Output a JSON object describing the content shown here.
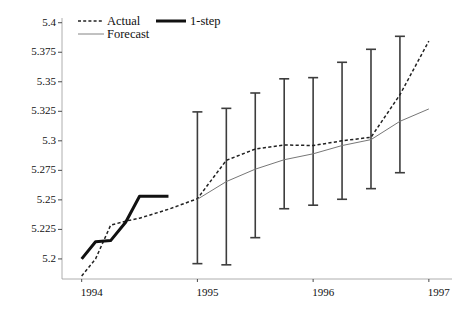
{
  "chart_data": {
    "type": "line",
    "title": "",
    "xlabel": "",
    "ylabel": "",
    "xlim": [
      1993.83,
      1997.2
    ],
    "ylim": [
      5.183,
      5.404
    ],
    "grid": false,
    "x_ticks": [
      "1994",
      "1995",
      "1996",
      "1997"
    ],
    "x_tick_values": [
      1994,
      1995,
      1996,
      1997
    ],
    "y_ticks": [
      "5.2",
      "5.225",
      "5.25",
      "5.275",
      "5.3",
      "5.325",
      "5.35",
      "5.375",
      "5.4"
    ],
    "y_tick_values": [
      5.2,
      5.225,
      5.25,
      5.275,
      5.3,
      5.325,
      5.35,
      5.375,
      5.4
    ],
    "legend": {
      "position": "top-left",
      "entries": [
        {
          "label": "Actual",
          "style": "dashed",
          "width": 1.4,
          "color": "#222222"
        },
        {
          "label": "Forecast",
          "style": "solid",
          "width": 0.9,
          "color": "#666666"
        },
        {
          "label": "1-step",
          "style": "solid",
          "width": 3.0,
          "color": "#111111"
        }
      ]
    },
    "series": [
      {
        "name": "Actual",
        "style": "dashed",
        "x": [
          1994.0,
          1994.12,
          1994.25,
          1994.38,
          1994.5,
          1994.75,
          1995.0,
          1995.25,
          1995.5,
          1995.75,
          1996.0,
          1996.25,
          1996.5,
          1996.75,
          1997.0
        ],
        "values": [
          5.1855,
          5.2,
          5.2285,
          5.232,
          5.2345,
          5.242,
          5.251,
          5.2835,
          5.293,
          5.2965,
          5.296,
          5.3,
          5.303,
          5.339,
          5.3845
        ]
      },
      {
        "name": "Forecast",
        "style": "solid-thin",
        "x": [
          1995.0,
          1995.25,
          1995.5,
          1995.75,
          1996.0,
          1996.25,
          1996.5,
          1996.75,
          1997.0
        ],
        "values": [
          5.2505,
          5.2655,
          5.276,
          5.284,
          5.289,
          5.296,
          5.301,
          5.3165,
          5.327
        ]
      },
      {
        "name": "1-step",
        "style": "solid-thick",
        "x": [
          1994.0,
          1994.12,
          1994.25,
          1994.38,
          1994.5,
          1994.75
        ],
        "values": [
          5.2,
          5.2145,
          5.2155,
          5.231,
          5.253,
          5.253
        ]
      }
    ],
    "error_bars": {
      "name": "Forecast interval",
      "x": [
        1995.0,
        1995.25,
        1995.5,
        1995.75,
        1996.0,
        1996.25,
        1996.5,
        1996.75
      ],
      "center": [
        5.2505,
        5.2655,
        5.276,
        5.284,
        5.289,
        5.296,
        5.301,
        5.3165
      ],
      "upper": [
        5.3245,
        5.3275,
        5.3405,
        5.3525,
        5.3535,
        5.3665,
        5.3775,
        5.3885
      ],
      "lower": [
        5.196,
        5.195,
        5.218,
        5.2425,
        5.2455,
        5.2505,
        5.2595,
        5.273
      ]
    }
  }
}
